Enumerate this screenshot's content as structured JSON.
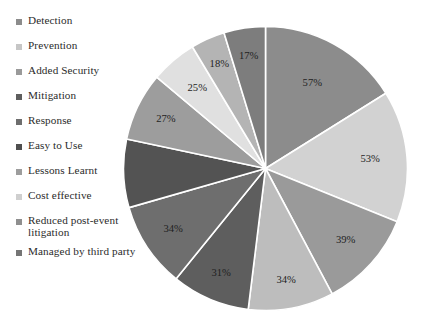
{
  "chart_data": {
    "type": "pie",
    "title": "",
    "legend_position": "left",
    "grid": false,
    "categories": [
      "Detection",
      "Prevention",
      "Added Security",
      "Mitigation",
      "Response",
      "Easy to Use",
      "Lessons Learnt",
      "Cost effective",
      "Reduced post-event litigation",
      "Managed by third party"
    ],
    "values": [
      57,
      53,
      39,
      34,
      31,
      34,
      27,
      25,
      18,
      17
    ],
    "labels": [
      "57%",
      "53%",
      "39%",
      "34%",
      "31%",
      "34%",
      "27%",
      "25%",
      "18%",
      "17%"
    ],
    "colors": [
      "#8c8c8c",
      "#d2d2d2",
      "#9a9a9a",
      "#bdbdbd",
      "#5e5e5e",
      "#6e6e6e",
      "#535353",
      "#9d9d9d",
      "#e0e0e0",
      "#b4b4b4"
    ],
    "unit": "%",
    "xlabel": "",
    "ylabel": ""
  },
  "legend": {
    "items": [
      {
        "label": "Detection",
        "color": "#8c8c8c"
      },
      {
        "label": "Prevention",
        "color": "#c6c6c6"
      },
      {
        "label": "Added Security",
        "color": "#9a9a9a"
      },
      {
        "label": "Mitigation",
        "color": "#5e5e5e"
      },
      {
        "label": "Response",
        "color": "#6e6e6e"
      },
      {
        "label": "Easy to Use",
        "color": "#4f4f4f"
      },
      {
        "label": "Lessons Learnt",
        "color": "#9d9d9d"
      },
      {
        "label": "Cost effective",
        "color": "#cfcfcf"
      },
      {
        "label": "Reduced post-event litigation",
        "color": "#8f8f8f"
      },
      {
        "label": "Managed by third party",
        "color": "#757575"
      }
    ]
  },
  "pie": {
    "slices": [
      {
        "name": "Detection",
        "label": "57%",
        "color": "#8c8c8c",
        "start": 0,
        "end": 58,
        "label_r": 0.68,
        "visible": true
      },
      {
        "name": "Prevention",
        "label": "53%",
        "color": "#d2d2d2",
        "start": 58,
        "end": 112,
        "label_r": 0.74,
        "visible": true
      },
      {
        "name": "Added Security",
        "label": "39%",
        "color": "#9a9a9a",
        "start": 112,
        "end": 152,
        "label_r": 0.76,
        "visible": true
      },
      {
        "name": "Mitigation",
        "label": "34%",
        "color": "#bdbdbd",
        "start": 152,
        "end": 187,
        "label_r": 0.8,
        "visible": true
      },
      {
        "name": "Response",
        "label": "31%",
        "color": "#5e5e5e",
        "start": 187,
        "end": 219,
        "label_r": 0.8,
        "visible": true
      },
      {
        "name": "Easy to Use",
        "label": "34%",
        "color": "#6e6e6e",
        "start": 219,
        "end": 254,
        "label_r": 0.78,
        "visible": true
      },
      {
        "name": "Lessons Learnt",
        "label": "27%",
        "color": "#535353",
        "start": 254,
        "end": 282,
        "label_r": 0.74,
        "visible": false
      },
      {
        "name": "Cost effective",
        "label": "27%",
        "color": "#9d9d9d",
        "start": 282,
        "end": 310,
        "label_r": 0.78,
        "visible": true
      },
      {
        "name": "Reduced post-event litigation",
        "label": "25%",
        "color": "#e0e0e0",
        "start": 310,
        "end": 329,
        "label_r": 0.74,
        "visible": true
      },
      {
        "name": "Managed by third party",
        "label": "18%",
        "color": "#b4b4b4",
        "start": 329,
        "end": 343,
        "label_r": 0.8,
        "visible": true
      },
      {
        "name": "Top Dark Slice",
        "label": "17%",
        "color": "#7d7d7d",
        "start": 343,
        "end": 360,
        "label_r": 0.8,
        "visible": true
      }
    ]
  }
}
